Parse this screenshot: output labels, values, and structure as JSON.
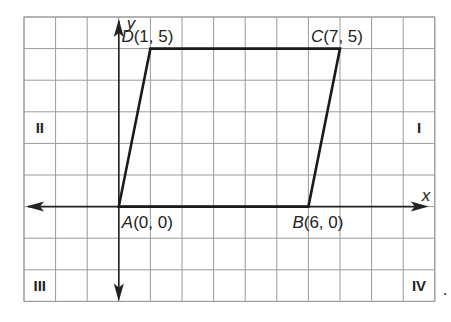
{
  "diagram": {
    "type": "coordinate-plane-parallelogram",
    "axes": {
      "x_label": "x",
      "y_label": "y"
    },
    "grid": {
      "x_min": -3,
      "x_max": 10,
      "y_min": -3,
      "y_max": 6
    },
    "vertices": [
      {
        "name": "A",
        "x": 0,
        "y": 0,
        "label": "(0, 0)",
        "position": "below-right"
      },
      {
        "name": "B",
        "x": 6,
        "y": 0,
        "label": "(6, 0)",
        "position": "below"
      },
      {
        "name": "C",
        "x": 7,
        "y": 5,
        "label": "(7, 5)",
        "position": "above"
      },
      {
        "name": "D",
        "x": 1,
        "y": 5,
        "label": "(1, 5)",
        "position": "above"
      }
    ],
    "quadrants": [
      {
        "label": "I",
        "position": "right-middle"
      },
      {
        "label": "II",
        "position": "left-middle"
      },
      {
        "label": "III",
        "position": "bottom-left"
      },
      {
        "label": "IV",
        "position": "bottom-right"
      }
    ],
    "trailing_mark": "."
  }
}
